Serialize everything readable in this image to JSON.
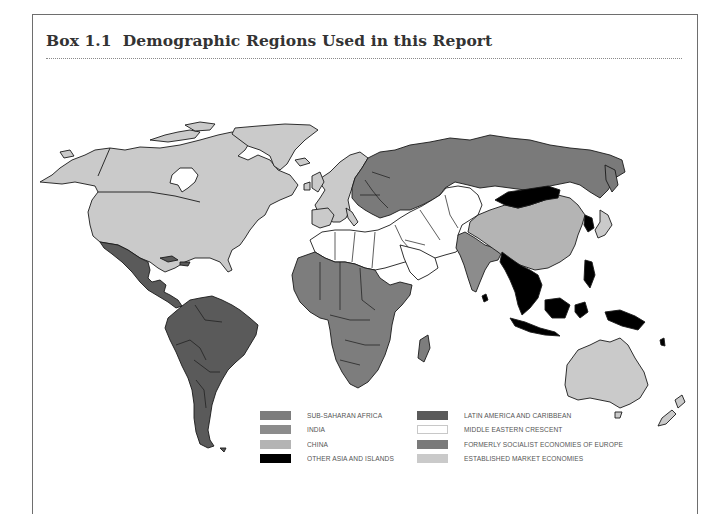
{
  "header": {
    "box_number": "Box 1.1",
    "title": "Demographic Regions Used in this Report"
  },
  "colors": {
    "sub_saharan_africa": "#7d7d7d",
    "india": "#8c8c8c",
    "china": "#b4b4b4",
    "other_asia_islands": "#000000",
    "latin_america": "#5a5a5a",
    "middle_eastern_crescent": "#ffffff",
    "formerly_socialist_europe": "#7a7a7a",
    "established_market": "#cacaca",
    "border": "#1a1a1a",
    "frame": "#6e6e6e"
  },
  "legend": {
    "left": [
      {
        "label": "SUB-SAHARAN AFRICA",
        "color": "#7d7d7d"
      },
      {
        "label": "INDIA",
        "color": "#8c8c8c"
      },
      {
        "label": "CHINA",
        "color": "#b4b4b4"
      },
      {
        "label": "OTHER ASIA AND ISLANDS",
        "color": "#000000"
      }
    ],
    "right": [
      {
        "label": "LATIN AMERICA AND CARIBBEAN",
        "color": "#5a5a5a"
      },
      {
        "label": "MIDDLE EASTERN CRESCENT",
        "color": "#ffffff"
      },
      {
        "label": "FORMERLY SOCIALIST ECONOMIES OF EUROPE",
        "color": "#7a7a7a"
      },
      {
        "label": "ESTABLISHED MARKET ECONOMIES",
        "color": "#cacaca"
      }
    ]
  },
  "map_regions": [
    "Established Market Economies: North America, Western Europe, Japan, Australia, New Zealand, Greenland",
    "Latin America and Caribbean: Mexico, Central America, South America, Caribbean",
    "Formerly Socialist Economies of Europe: Russia and Eastern Europe",
    "Middle Eastern Crescent: North Africa, Middle East, Central Asia, Pakistan",
    "Sub-Saharan Africa",
    "India",
    "China",
    "Other Asia and Islands: Mongolia, Southeast Asia, Indonesia, Korea, Pacific islands"
  ]
}
